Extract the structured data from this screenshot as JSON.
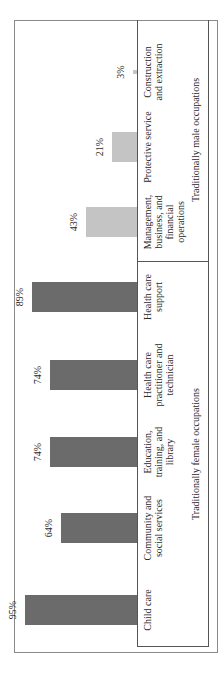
{
  "chart_data": {
    "type": "bar",
    "orientation": "rotated page (vertical bars, image rotated 90° counterclockwise)",
    "title": "",
    "xlabel": "",
    "ylabel": "",
    "categories": [
      "Child care",
      "Community and social services",
      "Education, training, and library",
      "Health care practitioner and technician",
      "Health care support",
      "Management, business, and financial operations",
      "Protective service",
      "Construction and extraction"
    ],
    "values": [
      95,
      64,
      74,
      74,
      89,
      43,
      21,
      3
    ],
    "value_labels": [
      "95%",
      "64%",
      "74%",
      "74%",
      "89%",
      "43%",
      "21%",
      "3%"
    ],
    "groups": [
      {
        "name": "Traditionally female occupations",
        "categories": [
          "Child care",
          "Community and social services",
          "Education, training, and library",
          "Health care practitioner and technician",
          "Health care support"
        ],
        "color": "#6b6b6b"
      },
      {
        "name": "Traditionally male occupations",
        "categories": [
          "Management, business, and financial operations",
          "Protective service",
          "Construction and extraction"
        ],
        "color": "#c4c4c4"
      }
    ],
    "ylim": [
      0,
      100
    ],
    "grid": false,
    "legend": "none (group labels beneath category labels)"
  },
  "labels": {
    "cats": [
      [
        "Child care"
      ],
      [
        "Community and",
        "social services"
      ],
      [
        "Education,",
        "training, and",
        "library"
      ],
      [
        "Health care",
        "practitioner and",
        "technician"
      ],
      [
        "Health care",
        "support"
      ],
      [
        "Management,",
        "business, and",
        "financial",
        "operations"
      ],
      [
        "Protective service"
      ],
      [
        "Construction",
        "and extraction"
      ]
    ],
    "group_female": "Traditionally female occupations",
    "group_male": "Traditionally male occupations"
  }
}
